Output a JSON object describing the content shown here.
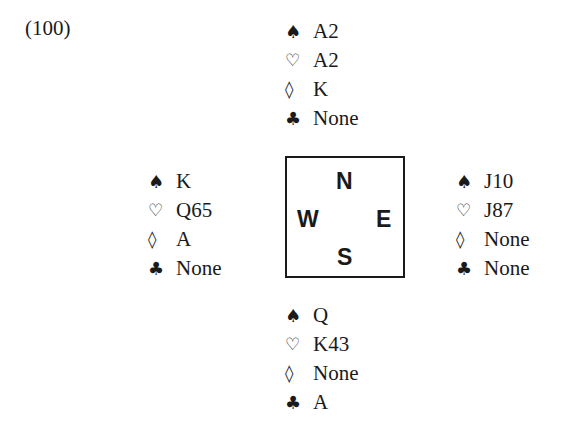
{
  "problem_number": "(100)",
  "compass": {
    "north": "N",
    "west": "W",
    "east": "E",
    "south": "S"
  },
  "suit_symbols": {
    "spades": "♠",
    "hearts": "♡",
    "diamonds": "◊",
    "clubs": "♣"
  },
  "hands": {
    "north": {
      "spades": "A2",
      "hearts": "A2",
      "diamonds": "K",
      "clubs": "None"
    },
    "west": {
      "spades": "K",
      "hearts": "Q65",
      "diamonds": "A",
      "clubs": "None"
    },
    "east": {
      "spades": "J10",
      "hearts": "J87",
      "diamonds": "None",
      "clubs": "None"
    },
    "south": {
      "spades": "Q",
      "hearts": "K43",
      "diamonds": "None",
      "clubs": "A"
    }
  }
}
